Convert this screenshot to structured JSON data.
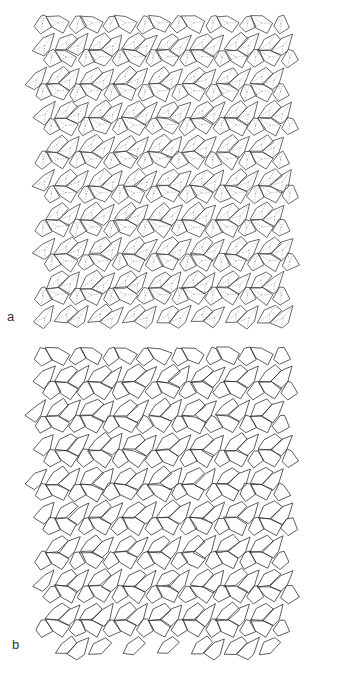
{
  "figure": {
    "panels": [
      {
        "label": "a",
        "description": "Pentagonal tiling with dashed internal subdivisions",
        "style": {
          "stroke": "#444444",
          "inner_dashed": true
        }
      },
      {
        "label": "b",
        "description": "Pentagonal tiling, solid edges only",
        "style": {
          "stroke": "#333333",
          "inner_dashed": false
        }
      }
    ]
  }
}
